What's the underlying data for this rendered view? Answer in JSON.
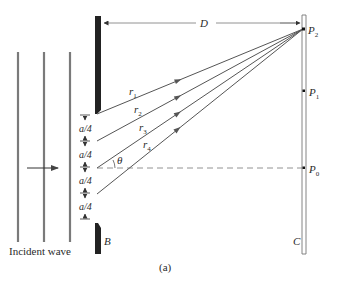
{
  "figure": {
    "caption": "(a)",
    "distance_label": "D",
    "barrier_label": "B",
    "screen_label": "C",
    "incident_label": "Incident wave",
    "angle_label": "θ",
    "spacing_labels": [
      "a/4",
      "a/4",
      "a/4",
      "a/4"
    ],
    "rays": [
      {
        "name": "r",
        "sub": "1"
      },
      {
        "name": "r",
        "sub": "2"
      },
      {
        "name": "r",
        "sub": "3"
      },
      {
        "name": "r",
        "sub": "4"
      }
    ],
    "points": [
      {
        "name": "P",
        "sub": "2"
      },
      {
        "name": "P",
        "sub": "1"
      },
      {
        "name": "P",
        "sub": "0"
      }
    ]
  },
  "colors": {
    "line": "#555555",
    "barrier": "#222222",
    "wavefront": "#7a7a7a",
    "text": "#2a2a2a"
  }
}
